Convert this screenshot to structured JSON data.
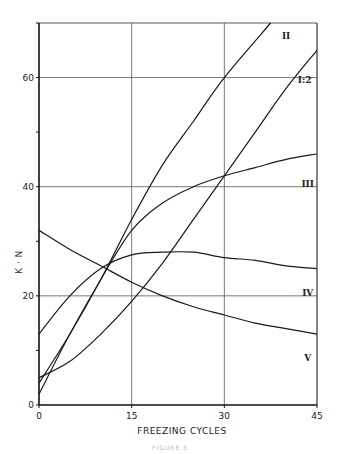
{
  "chart_data": {
    "type": "line",
    "title": "",
    "xlabel": "FREEZING CYCLES",
    "ylabel": "K · N",
    "xlim": [
      0,
      45
    ],
    "ylim": [
      0,
      70
    ],
    "xticks": [
      0,
      15,
      30,
      45
    ],
    "yticks": [
      0,
      20,
      40,
      60
    ],
    "grid": true,
    "legend": "inline labels at right end of curves",
    "series": [
      {
        "name": "II",
        "x": [
          0,
          5,
          10,
          15,
          20,
          25,
          30,
          37.5
        ],
        "values": [
          4,
          13,
          23,
          34,
          44,
          52,
          60,
          70
        ]
      },
      {
        "name": "I:2",
        "x": [
          0,
          5,
          10,
          15,
          20,
          25,
          30,
          35,
          40,
          45
        ],
        "values": [
          5,
          8,
          13,
          19,
          26,
          34,
          42,
          50,
          58,
          65
        ]
      },
      {
        "name": "III",
        "x": [
          0,
          5,
          10,
          15,
          20,
          25,
          30,
          35,
          40,
          45
        ],
        "values": [
          2,
          13,
          23,
          32,
          37,
          40,
          42,
          43.5,
          45,
          46
        ]
      },
      {
        "name": "IV",
        "x": [
          0,
          5,
          10,
          15,
          20,
          25,
          30,
          35,
          40,
          45
        ],
        "values": [
          13,
          20,
          25,
          27.5,
          28,
          28,
          27,
          26.5,
          25.5,
          25
        ]
      },
      {
        "name": "V",
        "x": [
          0,
          5,
          10,
          15,
          20,
          25,
          30,
          35,
          40,
          45
        ],
        "values": [
          32,
          28.5,
          25.5,
          22.5,
          20,
          18,
          16.5,
          15,
          14,
          13
        ]
      }
    ],
    "label_positions": {
      "II": {
        "x": 40,
        "y": 67
      },
      "I:2": {
        "x": 43,
        "y": 59
      },
      "III": {
        "x": 43.5,
        "y": 40
      },
      "IV": {
        "x": 43.5,
        "y": 20
      },
      "V": {
        "x": 43.5,
        "y": 8
      }
    }
  },
  "caption": "FIGURE 5"
}
